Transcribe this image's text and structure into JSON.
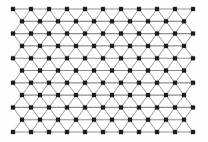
{
  "figure": {
    "background_color": "#fefefe"
  },
  "chart_data": {
    "type": "scatter",
    "title": "",
    "subtitle": "",
    "xlabel": "",
    "ylabel": "",
    "grid": false,
    "legend": null,
    "axis_visible": false,
    "tick_labels_x": [],
    "tick_labels_y": [],
    "lattice": {
      "rows": 11,
      "nodes_per_odd_row": 11,
      "nodes_per_even_row": 10,
      "total_nodes": 116,
      "x_origin": 13,
      "y_origin": 9,
      "x_spacing": 18.0,
      "y_spacing": 12.3,
      "row_offset": 9.0,
      "node_size": 4.0,
      "node_shape": "square",
      "node_color": "#1c1c1c",
      "horizontal_edge_color": "#8d8d8d",
      "diagonal_edge_color": "#9a9a9a",
      "horizontal_edge_width": 1.15,
      "diagonal_edge_width": 1.0
    },
    "x": [
      13,
      31,
      49,
      67,
      85,
      103,
      121,
      139,
      157,
      175,
      193
    ],
    "y": [
      9,
      21.3,
      33.6,
      45.9,
      58.2,
      70.5,
      82.8,
      95.1,
      107.4,
      119.7,
      132
    ],
    "row_node_counts": [
      11,
      10,
      11,
      10,
      11,
      10,
      11,
      10,
      11,
      10,
      11
    ]
  }
}
